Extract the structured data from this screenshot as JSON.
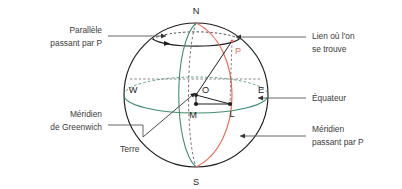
{
  "figure": {
    "subject": "Terre",
    "background_color": "#ffffff",
    "colors": {
      "outline": "#1d1d1d",
      "greenwich_meridian": "#3f8f6d",
      "equator": "#3f8f6d",
      "meridian_through_p": "#e8705a",
      "point_p": "#e8705a",
      "callout_text": "#3b3b3b",
      "leader_line": "#555555"
    }
  },
  "callouts": {
    "parallel_through_p": {
      "line1": "Parallèle",
      "line2": "passant par P",
      "side": "left"
    },
    "greenwich_meridian": {
      "line1": "Méridien",
      "line2": "de Greenwich",
      "side": "left"
    },
    "location": {
      "line1": "Lien où l'on",
      "line2": "se trouve",
      "side": "right"
    },
    "equator": {
      "line1": "Équateur",
      "line2": "",
      "side": "right"
    },
    "meridian_through_p": {
      "line1": "Méridien",
      "line2": "passant par P",
      "side": "right"
    }
  },
  "sphere_labels": {
    "north_pole": "N",
    "south_pole": "S",
    "east": "E",
    "west": "W",
    "center": "O",
    "point_m": "M",
    "point_l": "L",
    "point_p": "P",
    "earth": "Terre"
  }
}
